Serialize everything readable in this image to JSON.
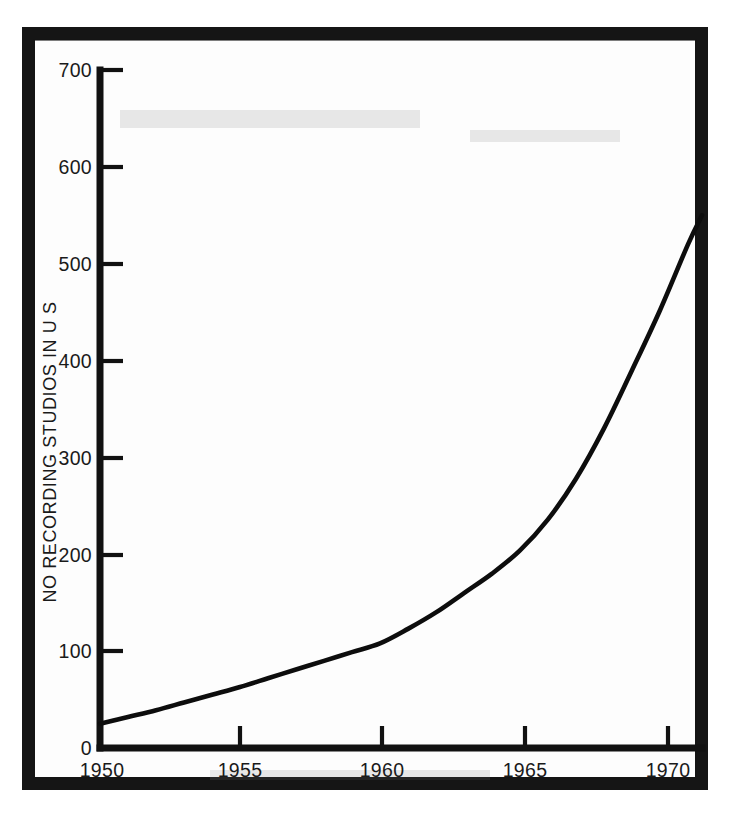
{
  "figure": {
    "background_color": "#ffffff",
    "frame_color": "#151515",
    "ink_color": "#0d0d0d"
  },
  "chart_data": {
    "type": "line",
    "title": "",
    "subtitle": "",
    "xlabel": "",
    "ylabel": "NO RECORDING STUDIOS IN U S",
    "xlim": [
      1950,
      1971.5
    ],
    "ylim": [
      0,
      700
    ],
    "grid": false,
    "legend": null,
    "xticks": [
      1950,
      1955,
      1960,
      1965,
      1970
    ],
    "xtick_labels": [
      "1950",
      "1955",
      "1960",
      "1965",
      "1970"
    ],
    "yticks": [
      0,
      100,
      200,
      300,
      400,
      500,
      600,
      700
    ],
    "ytick_labels": [
      "0",
      "100",
      "200",
      "300",
      "400",
      "500",
      "600",
      "700"
    ],
    "series": [
      {
        "name": "Number of recording studios in U S",
        "x": [
          1950,
          1951,
          1952,
          1953,
          1954,
          1955,
          1956,
          1957,
          1958,
          1959,
          1960,
          1961,
          1962,
          1963,
          1964,
          1965,
          1966,
          1967,
          1968,
          1969,
          1970,
          1971,
          1971.5
        ],
        "values": [
          25,
          32,
          39,
          47,
          55,
          63,
          72,
          81,
          90,
          99,
          108,
          123,
          140,
          160,
          180,
          204,
          236,
          278,
          330,
          390,
          452,
          520,
          550
        ]
      }
    ],
    "annotations": []
  },
  "axis_labels": {
    "y_axis_title": "NO RECORDING STUDIOS IN U S",
    "y_700": "700",
    "y_600": "600",
    "y_500": "500",
    "y_400": "400",
    "y_300": "300",
    "y_200": "200",
    "y_100": "100",
    "y_0": "0",
    "x_1950": "1950",
    "x_1955": "1955",
    "x_1960": "1960",
    "x_1965": "1965",
    "x_1970": "1970"
  }
}
